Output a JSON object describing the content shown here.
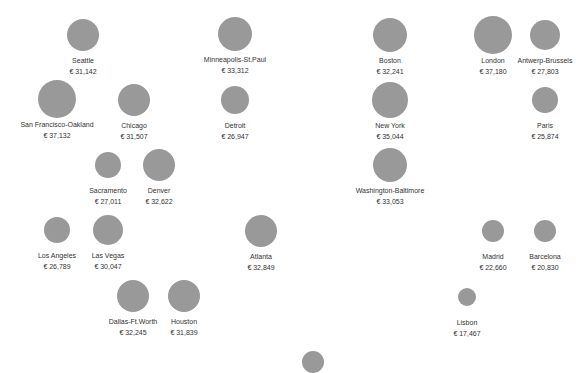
{
  "chart_data": {
    "type": "scatter",
    "subtype": "bubble-grid",
    "title": "",
    "xlabel": "",
    "ylabel": "",
    "grid": false,
    "legend": null,
    "currency_symbol": "€",
    "bubble_color": "#999999",
    "text_color": "#333333",
    "points": [
      {
        "city": "Seattle",
        "value": 31142,
        "label": "€ 31,142",
        "cx": 83,
        "cy": 35,
        "r": 16
      },
      {
        "city": "Minneapolis-St.Paul",
        "value": 33312,
        "label": "€ 33,312",
        "cx": 235,
        "cy": 34,
        "r": 17
      },
      {
        "city": "Boston",
        "value": 32241,
        "label": "€ 32,241",
        "cx": 390,
        "cy": 35,
        "r": 17
      },
      {
        "city": "London",
        "value": 37180,
        "label": "€ 37,180",
        "cx": 493,
        "cy": 35,
        "r": 19
      },
      {
        "city": "Antwerp-Brussels",
        "value": 27803,
        "label": "€ 27,803",
        "cx": 545,
        "cy": 35,
        "r": 15
      },
      {
        "city": "San Francisco-Oakland",
        "value": 37132,
        "label": "€ 37,132",
        "cx": 57,
        "cy": 99,
        "r": 19
      },
      {
        "city": "Chicago",
        "value": 31507,
        "label": "€ 31,507",
        "cx": 134,
        "cy": 100,
        "r": 16
      },
      {
        "city": "Detroit",
        "value": 26947,
        "label": "€ 26,947",
        "cx": 235,
        "cy": 100,
        "r": 14
      },
      {
        "city": "New York",
        "value": 35044,
        "label": "€ 35,044",
        "cx": 390,
        "cy": 100,
        "r": 18
      },
      {
        "city": "Paris",
        "value": 25874,
        "label": "€ 25,874",
        "cx": 545,
        "cy": 100,
        "r": 13
      },
      {
        "city": "Sacramento",
        "value": 27011,
        "label": "€ 27,011",
        "cx": 108,
        "cy": 165,
        "r": 13
      },
      {
        "city": "Denver",
        "value": 32622,
        "label": "€ 32,622",
        "cx": 159,
        "cy": 165,
        "r": 16
      },
      {
        "city": "Washington-Baltimore",
        "value": 33053,
        "label": "€ 33,053",
        "cx": 390,
        "cy": 165,
        "r": 17
      },
      {
        "city": "Los Angeles",
        "value": 26789,
        "label": "€ 26,789",
        "cx": 57,
        "cy": 230,
        "r": 13
      },
      {
        "city": "Las Vegas",
        "value": 30047,
        "label": "€ 30,047",
        "cx": 108,
        "cy": 230,
        "r": 15
      },
      {
        "city": "Atlanta",
        "value": 32849,
        "label": "€ 32,849",
        "cx": 261,
        "cy": 231,
        "r": 16
      },
      {
        "city": "Madrid",
        "value": 22660,
        "label": "€ 22,660",
        "cx": 493,
        "cy": 231,
        "r": 11
      },
      {
        "city": "Barcelona",
        "value": 20830,
        "label": "€ 20,830",
        "cx": 545,
        "cy": 231,
        "r": 11
      },
      {
        "city": "Dallas-Ft.Worth",
        "value": 32245,
        "label": "€ 32,245",
        "cx": 133,
        "cy": 296,
        "r": 16
      },
      {
        "city": "Houston",
        "value": 31839,
        "label": "€ 31,839",
        "cx": 184,
        "cy": 296,
        "r": 16
      },
      {
        "city": "Lisbon",
        "value": 17467,
        "label": "€ 17,467",
        "cx": 467,
        "cy": 297,
        "r": 9
      },
      {
        "city": "",
        "value": null,
        "label": "",
        "cx": 313,
        "cy": 362,
        "r": 11
      }
    ]
  }
}
